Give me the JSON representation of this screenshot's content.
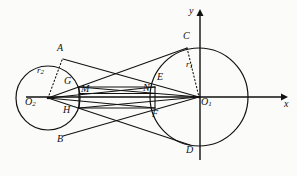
{
  "figure": {
    "type": "geometry-diagram",
    "background_color": "#fbfbfa",
    "stroke_color": "#111111"
  },
  "axes": {
    "x_label": "x",
    "y_label": "y",
    "origin_x": 200,
    "origin_y": 97,
    "x_axis_end": 284,
    "y_axis_end": 12
  },
  "circles": [
    {
      "name": "circle-1",
      "center_label": "O",
      "center_sub": "1",
      "radius_label": "r",
      "radius_sub": "1",
      "cx": 199,
      "cy": 97,
      "r": 49
    },
    {
      "name": "circle-2",
      "center_label": "O",
      "center_sub": "2",
      "radius_label": "r",
      "radius_sub": "2",
      "cx": 48,
      "cy": 98,
      "r": 32
    }
  ],
  "points": [
    {
      "id": "A",
      "label": "A",
      "x": 57,
      "y": 49,
      "px": 63,
      "py": 59
    },
    {
      "id": "B",
      "label": "B",
      "x": 57,
      "y": 137,
      "px": 63,
      "py": 136
    },
    {
      "id": "C",
      "label": "C",
      "x": 183,
      "y": 36,
      "px": 187,
      "py": 48
    },
    {
      "id": "D",
      "label": "D",
      "x": 187,
      "y": 148,
      "px": 190,
      "py": 145
    },
    {
      "id": "E",
      "label": "E",
      "x": 157,
      "y": 77,
      "px": 155,
      "py": 87
    },
    {
      "id": "F",
      "label": "F",
      "x": 153,
      "y": 110,
      "px": 155,
      "py": 108
    },
    {
      "id": "G",
      "label": "G",
      "x": 65,
      "y": 78,
      "px": 79,
      "py": 87
    },
    {
      "id": "H",
      "label": "H",
      "x": 64,
      "y": 107,
      "px": 79,
      "py": 108
    },
    {
      "id": "M",
      "label": "M",
      "x": 80,
      "y": 84,
      "px": 79,
      "py": 92
    },
    {
      "id": "N",
      "label": "N",
      "x": 144,
      "y": 83,
      "px": 155,
      "py": 92
    }
  ],
  "labels": {
    "O1": {
      "base": "O",
      "sub": "1",
      "x": 201,
      "y": 98
    },
    "O2": {
      "base": "O",
      "sub": "2",
      "x": 26,
      "y": 98
    },
    "r1": {
      "base": "r",
      "sub": "1",
      "x": 186,
      "y": 63
    },
    "r2": {
      "base": "r",
      "sub": "2",
      "x": 38,
      "y": 69
    },
    "x": {
      "base": "x",
      "x": 285,
      "y": 99
    },
    "y": {
      "base": "y",
      "x": 190,
      "y": 11
    }
  },
  "segments": [
    {
      "name": "tangent-upper-outer",
      "from": "O2c",
      "to": "C"
    },
    {
      "name": "tangent-lower-outer",
      "from": "O2c",
      "to": "D"
    },
    {
      "name": "chord-A-to-O1",
      "from": "A",
      "to": "O1c"
    },
    {
      "name": "chord-B-to-O1",
      "from": "B",
      "to": "O1c"
    },
    {
      "name": "spoke-O2-E",
      "from": "O2c",
      "to": "E"
    },
    {
      "name": "spoke-O2-F",
      "from": "O2c",
      "to": "F"
    },
    {
      "name": "spoke-G-O1",
      "from": "G",
      "to": "O1c"
    },
    {
      "name": "spoke-H-O1",
      "from": "H",
      "to": "O1c"
    },
    {
      "name": "rect-top-GE",
      "from": "G",
      "to": "E"
    },
    {
      "name": "rect-bottom-HF",
      "from": "H",
      "to": "F"
    },
    {
      "name": "rect-mid-MN",
      "from": "M",
      "to": "N"
    },
    {
      "name": "rect-left-side",
      "from": "G",
      "to": "H"
    },
    {
      "name": "rect-right-side",
      "from": "E",
      "to": "F"
    }
  ],
  "dotted_segments": [
    {
      "name": "radius-r1-dotted",
      "from": "C",
      "to": "O1c"
    },
    {
      "name": "radius-r2-dotted",
      "from": "A",
      "to": "O2c"
    }
  ]
}
